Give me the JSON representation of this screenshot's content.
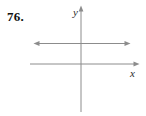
{
  "problem": {
    "number": "76."
  },
  "figure": {
    "y_axis_label": "y",
    "x_axis_label": "x"
  },
  "colors": {
    "background": "#ffffff",
    "line": "#8c8c8c",
    "label_text": "#2b2b2b",
    "problem_text": "#111111"
  }
}
